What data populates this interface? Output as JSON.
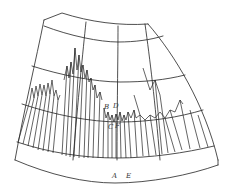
{
  "figure": {
    "line_color": "#222222",
    "background": "#ffffff",
    "labels": {
      "B": "B",
      "D": "D",
      "C": "C",
      "F": "F",
      "A": "A",
      "E": "E"
    }
  }
}
